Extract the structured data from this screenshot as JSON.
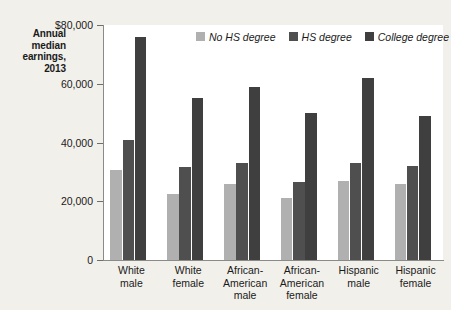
{
  "chart_data": {
    "type": "bar",
    "title": "Annual median earnings, 2013",
    "xlabel": "",
    "ylabel": "Annual median earnings, 2013",
    "ylim": [
      0,
      80000
    ],
    "grid": false,
    "legend_position": "top-center",
    "categories": [
      "White male",
      "White female",
      "African-American male",
      "African-American female",
      "Hispanic male",
      "Hispanic female"
    ],
    "category_lines": [
      [
        "White",
        "male"
      ],
      [
        "White",
        "female"
      ],
      [
        "African-",
        "American",
        "male"
      ],
      [
        "African-",
        "American",
        "female"
      ],
      [
        "Hispanic",
        "male"
      ],
      [
        "Hispanic",
        "female"
      ]
    ],
    "series": [
      {
        "name": "No HS degree",
        "color": "#b0b0b0",
        "values": [
          30500,
          22500,
          26000,
          21000,
          27000,
          26000
        ]
      },
      {
        "name": "HS degree",
        "color": "#4f4f4f",
        "values": [
          41000,
          31500,
          33000,
          26500,
          33000,
          32000
        ]
      },
      {
        "name": "College degree",
        "color": "#3f3f3f",
        "values": [
          76000,
          55000,
          59000,
          50000,
          62000,
          49000
        ]
      }
    ],
    "yticks": [
      0,
      20000,
      40000,
      60000,
      80000
    ],
    "ytick_labels": [
      "0",
      "20,000",
      "40,000",
      "60,000",
      "$80,000"
    ]
  },
  "axis_title": {
    "line1": "Annual",
    "line2": "median",
    "line3": "earnings,",
    "line4": "2013"
  },
  "colors": {
    "page_background": "#f2f0ea",
    "plot_background": "#ffffff",
    "axis": "#8a8a86",
    "text": "#1a1a1a"
  }
}
